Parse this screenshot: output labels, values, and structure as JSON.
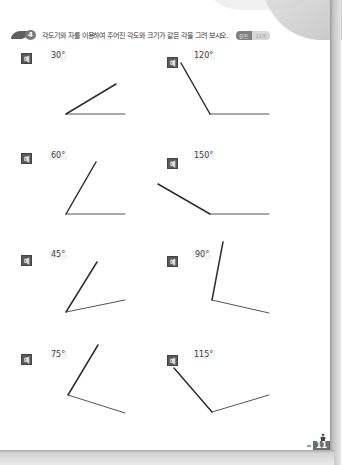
{
  "header": {
    "problem_number": "4",
    "question": "각도기와 자를 이용하여 주어진 각도와 크기가 같은 각을 그려 보시오.",
    "hint_tag": "힌트",
    "hint_ref": "11쪽"
  },
  "example_label": "예",
  "examples": [
    {
      "angle": "30°"
    },
    {
      "angle": "120°"
    },
    {
      "angle": "60°"
    },
    {
      "angle": "150°"
    },
    {
      "angle": "45°"
    },
    {
      "angle": "90°"
    },
    {
      "angle": "75°"
    },
    {
      "angle": "115°"
    }
  ],
  "footer": {
    "page_number": "11"
  }
}
